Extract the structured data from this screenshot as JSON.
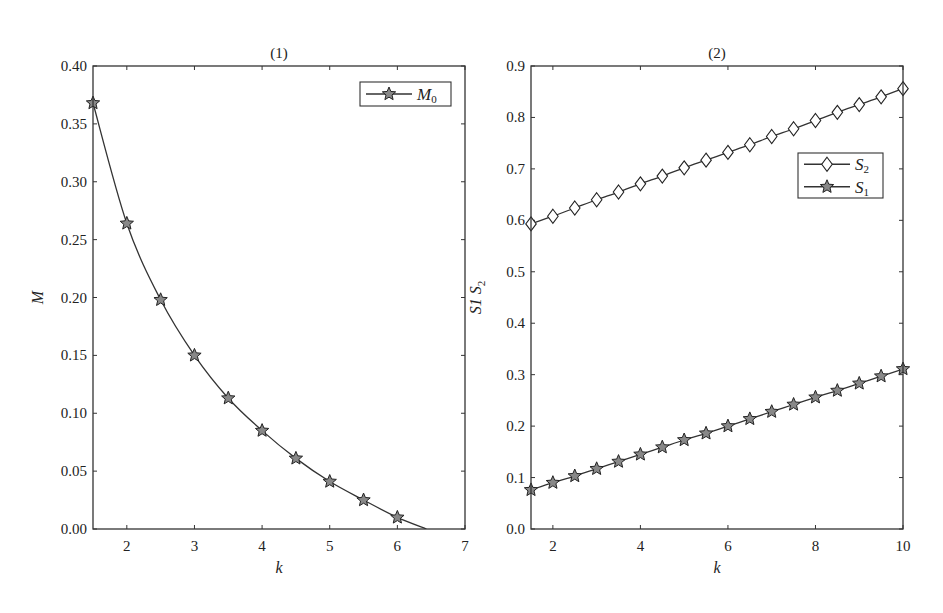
{
  "chart_data": [
    {
      "type": "line",
      "title": "(1)",
      "xlabel": "k",
      "ylabel": "M",
      "xlim": [
        1.5,
        7
      ],
      "ylim": [
        0,
        0.4
      ],
      "xticks": [
        2,
        3,
        4,
        5,
        6,
        7
      ],
      "xtick_labels": [
        "2",
        "3",
        "4",
        "5",
        "6",
        "7"
      ],
      "yticks": [
        0,
        0.05,
        0.1,
        0.15,
        0.2,
        0.25,
        0.3,
        0.35,
        0.4
      ],
      "ytick_labels": [
        "0.00",
        "0.05",
        "0.10",
        "0.15",
        "0.20",
        "0.25",
        "0.30",
        "0.35",
        "0.40"
      ],
      "grid": false,
      "legend_position": "upper right",
      "series": [
        {
          "name": "M0",
          "legend_main": "M",
          "legend_sub": "0",
          "marker": "star",
          "x": [
            1.5,
            2.0,
            2.5,
            3.0,
            3.5,
            4.0,
            4.5,
            5.0,
            5.5,
            6.0
          ],
          "values": [
            0.368,
            0.264,
            0.198,
            0.15,
            0.113,
            0.085,
            0.061,
            0.041,
            0.025,
            0.01
          ],
          "line_extends_to": [
            6.43,
            0.0
          ]
        }
      ]
    },
    {
      "type": "line",
      "title": "(2)",
      "xlabel": "k",
      "ylabel": "S1 S2",
      "xlim": [
        1.5,
        10
      ],
      "ylim": [
        0,
        0.9
      ],
      "xticks": [
        2,
        4,
        6,
        8,
        10
      ],
      "xtick_labels": [
        "2",
        "4",
        "6",
        "8",
        "10"
      ],
      "yticks": [
        0,
        0.1,
        0.2,
        0.3,
        0.4,
        0.5,
        0.6,
        0.7,
        0.8,
        0.9
      ],
      "ytick_labels": [
        "0.0",
        "0.1",
        "0.2",
        "0.3",
        "0.4",
        "0.5",
        "0.6",
        "0.7",
        "0.8",
        "0.9"
      ],
      "grid": false,
      "legend_position": "right, upper-middle",
      "series": [
        {
          "name": "S2",
          "legend_main": "S",
          "legend_sub": "2",
          "marker": "diamond",
          "x": [
            1.5,
            2.0,
            2.5,
            3.0,
            3.5,
            4.0,
            4.5,
            5.0,
            5.5,
            6.0,
            6.5,
            7.0,
            7.5,
            8.0,
            8.5,
            9.0,
            9.5,
            10.0
          ],
          "values": [
            0.593,
            0.608,
            0.624,
            0.64,
            0.655,
            0.671,
            0.686,
            0.702,
            0.717,
            0.732,
            0.747,
            0.763,
            0.778,
            0.794,
            0.81,
            0.825,
            0.84,
            0.856
          ]
        },
        {
          "name": "S1",
          "legend_main": "S",
          "legend_sub": "1",
          "marker": "star",
          "x": [
            1.5,
            2.0,
            2.5,
            3.0,
            3.5,
            4.0,
            4.5,
            5.0,
            5.5,
            6.0,
            6.5,
            7.0,
            7.5,
            8.0,
            8.5,
            9.0,
            9.5,
            10.0
          ],
          "values": [
            0.076,
            0.09,
            0.103,
            0.117,
            0.131,
            0.145,
            0.159,
            0.173,
            0.186,
            0.2,
            0.214,
            0.228,
            0.242,
            0.256,
            0.269,
            0.283,
            0.297,
            0.311
          ]
        }
      ]
    }
  ],
  "panels": [
    {
      "title": "(1)",
      "xlabel": "k",
      "ylabel": "M"
    },
    {
      "title": "(2)",
      "xlabel": "k",
      "ylabel_part1": "S1 S",
      "ylabel_sub": "2"
    }
  ]
}
